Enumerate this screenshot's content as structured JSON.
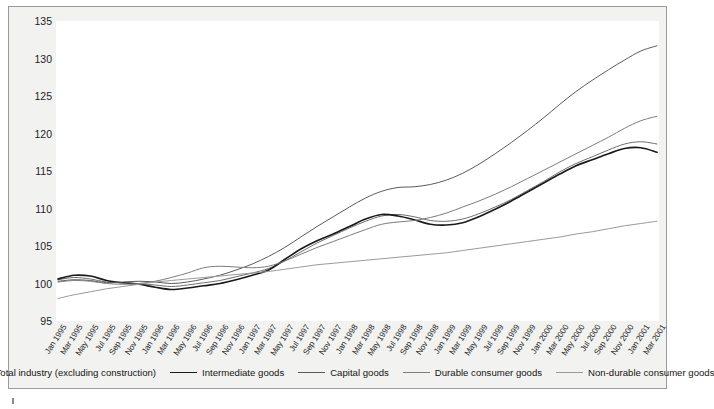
{
  "chart_data": {
    "type": "line",
    "title": "",
    "xlabel": "",
    "ylabel": "",
    "ylim": [
      95,
      135
    ],
    "yticks": [
      95,
      100,
      105,
      110,
      115,
      120,
      125,
      130,
      135
    ],
    "grid": false,
    "legend_position": "bottom",
    "x": [
      "Jan 1995",
      "Mar 1995",
      "May 1995",
      "Jul 1995",
      "Sep 1995",
      "Nov 1995",
      "Jan 1996",
      "Mar 1996",
      "May 1996",
      "Jul 1996",
      "Sep 1996",
      "Nov 1996",
      "Jan 1997",
      "Mar 1997",
      "May 1997",
      "Jul 1997",
      "Sep 1997",
      "Nov 1997",
      "Jan 1998",
      "Mar 1998",
      "May 1998",
      "Jul 1998",
      "Sep 1998",
      "Nov 1998",
      "Jan 1999",
      "Mar 1999",
      "May 1999",
      "Jul 1999",
      "Sep 1999",
      "Nov 1999",
      "Jan 2000",
      "Mar 2000",
      "May 2000",
      "Jul 2000",
      "Sep 2000",
      "Nov 2000",
      "Jan 2001",
      "Mar 2001"
    ],
    "series": [
      {
        "name": "Total industry (excluding construction)",
        "color": "#6e6e6e",
        "width": 1.0,
        "values": [
          100.5,
          100.8,
          100.6,
          100.2,
          100.1,
          100.0,
          99.8,
          99.6,
          99.8,
          100.1,
          100.4,
          100.9,
          101.4,
          102.0,
          103.0,
          104.2,
          105.4,
          106.4,
          107.4,
          108.3,
          109.0,
          109.2,
          108.9,
          108.4,
          108.3,
          108.6,
          109.3,
          110.2,
          111.2,
          112.4,
          113.6,
          114.9,
          116.0,
          116.9,
          117.8,
          118.6,
          118.9,
          118.6
        ]
      },
      {
        "name": "Intermediate goods",
        "color": "#1a1a1a",
        "width": 1.7,
        "values": [
          100.6,
          101.1,
          101.0,
          100.4,
          100.1,
          99.9,
          99.5,
          99.2,
          99.4,
          99.7,
          100.0,
          100.5,
          101.1,
          101.8,
          103.2,
          104.6,
          105.7,
          106.6,
          107.6,
          108.6,
          109.2,
          109.0,
          108.5,
          107.9,
          107.8,
          108.1,
          108.9,
          109.9,
          111.0,
          112.2,
          113.4,
          114.6,
          115.7,
          116.5,
          117.3,
          118.0,
          118.1,
          117.5
        ]
      },
      {
        "name": "Capital goods",
        "color": "#5a5a5a",
        "width": 1.0,
        "values": [
          100.3,
          100.5,
          100.4,
          100.1,
          100.2,
          100.3,
          100.2,
          100.0,
          100.2,
          100.6,
          101.1,
          101.8,
          102.6,
          103.6,
          104.8,
          106.2,
          107.6,
          108.9,
          110.2,
          111.4,
          112.3,
          112.8,
          112.9,
          113.2,
          113.8,
          114.7,
          115.9,
          117.3,
          118.8,
          120.4,
          122.1,
          123.9,
          125.6,
          127.1,
          128.5,
          129.8,
          131.0,
          131.7
        ]
      },
      {
        "name": "Durable consumer goods",
        "color": "#7d7d7d",
        "width": 1.0,
        "values": [
          100.2,
          100.4,
          100.3,
          100.0,
          99.9,
          100.0,
          100.3,
          100.8,
          101.4,
          102.1,
          102.3,
          102.2,
          102.1,
          102.3,
          103.0,
          103.9,
          104.8,
          105.6,
          106.4,
          107.2,
          107.9,
          108.2,
          108.4,
          108.8,
          109.4,
          110.2,
          111.0,
          111.9,
          112.9,
          114.0,
          115.1,
          116.2,
          117.3,
          118.4,
          119.5,
          120.7,
          121.7,
          122.3
        ]
      },
      {
        "name": "Non-durable consumer goods",
        "color": "#9a9a9a",
        "width": 1.0,
        "values": [
          98.0,
          98.5,
          98.9,
          99.3,
          99.6,
          99.9,
          100.2,
          100.4,
          100.6,
          100.8,
          101.0,
          101.2,
          101.4,
          101.6,
          101.9,
          102.2,
          102.5,
          102.7,
          102.9,
          103.1,
          103.3,
          103.5,
          103.7,
          103.9,
          104.1,
          104.4,
          104.7,
          105.0,
          105.3,
          105.6,
          105.9,
          106.2,
          106.6,
          106.9,
          107.3,
          107.7,
          108.0,
          108.3
        ]
      }
    ]
  },
  "legend": {
    "items": [
      {
        "label": "Total industry (excluding construction)"
      },
      {
        "label": "Intermediate goods"
      },
      {
        "label": "Capital goods"
      },
      {
        "label": "Durable consumer goods"
      },
      {
        "label": "Non-durable consumer goods"
      }
    ]
  }
}
